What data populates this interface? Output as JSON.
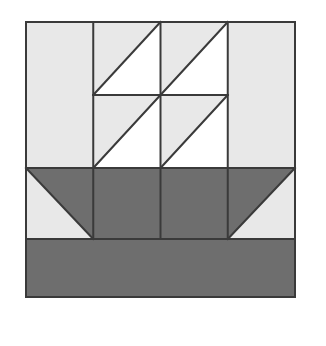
{
  "image": {
    "title": "Sailboat quilt block",
    "width": 326,
    "height": 346,
    "background_color": "#ffffff"
  },
  "block": {
    "name": "sailboat-quilt-block",
    "x": 26,
    "y": 22,
    "width": 269,
    "height": 275,
    "columns": 4,
    "rows": 4,
    "column_edges": [
      26,
      93.25,
      160.5,
      227.75,
      295
    ],
    "row_edges": [
      22,
      95,
      168,
      239,
      297
    ],
    "outline_color": "#3a3a3a",
    "outline_width": 2
  },
  "colors": {
    "background_fabric": "#e8e8e8",
    "sail_fabric": "#ffffff",
    "hull_fabric": "#6e6e6e",
    "water_fabric": "#6e6e6e",
    "seam_line": "#3a3a3a",
    "page_white": "#ffffff"
  },
  "legend": {
    "background_label": "light gray background",
    "sail_label": "white sail",
    "hull_label": "dark gray hull",
    "water_label": "dark gray water"
  },
  "patches": [
    {
      "name": "patch-r1c1-background",
      "row": 1,
      "col": 1,
      "shape": "square",
      "points": "26,22 93.25,22 93.25,95 26,95",
      "fill": "#e8e8e8",
      "label": "background"
    },
    {
      "name": "patch-r1c2-sail-upper",
      "row": 1,
      "col": 2,
      "shape": "triangle",
      "points": "93.25,22 160.5,22 93.25,95",
      "fill": "#e8e8e8",
      "label": "background half"
    },
    {
      "name": "patch-r1c2-sail-lower",
      "row": 1,
      "col": 2,
      "shape": "triangle",
      "points": "160.5,22 160.5,95 93.25,95",
      "fill": "#ffffff",
      "label": "sail half"
    },
    {
      "name": "patch-r1c3-sail-upper",
      "row": 1,
      "col": 3,
      "shape": "triangle",
      "points": "160.5,22 227.75,22 160.5,95",
      "fill": "#e8e8e8",
      "label": "background half"
    },
    {
      "name": "patch-r1c3-sail-lower",
      "row": 1,
      "col": 3,
      "shape": "triangle",
      "points": "227.75,22 227.75,95 160.5,95",
      "fill": "#ffffff",
      "label": "sail half"
    },
    {
      "name": "patch-r1c4-background",
      "row": 1,
      "col": 4,
      "shape": "square",
      "points": "227.75,22 295,22 295,95 227.75,95",
      "fill": "#e8e8e8",
      "label": "background"
    },
    {
      "name": "patch-r2c1-background",
      "row": 2,
      "col": 1,
      "shape": "square",
      "points": "26,95 93.25,95 93.25,168 26,168",
      "fill": "#e8e8e8",
      "label": "background"
    },
    {
      "name": "patch-r2c2-sail-upper",
      "row": 2,
      "col": 2,
      "shape": "triangle",
      "points": "93.25,95 160.5,95 93.25,168",
      "fill": "#e8e8e8",
      "label": "background half"
    },
    {
      "name": "patch-r2c2-sail-lower",
      "row": 2,
      "col": 2,
      "shape": "triangle",
      "points": "160.5,95 160.5,168 93.25,168",
      "fill": "#ffffff",
      "label": "sail half"
    },
    {
      "name": "patch-r2c3-sail-upper",
      "row": 2,
      "col": 3,
      "shape": "triangle",
      "points": "160.5,95 227.75,95 160.5,168",
      "fill": "#e8e8e8",
      "label": "background half"
    },
    {
      "name": "patch-r2c3-sail-lower",
      "row": 2,
      "col": 3,
      "shape": "triangle",
      "points": "227.75,95 227.75,168 160.5,168",
      "fill": "#ffffff",
      "label": "sail half"
    },
    {
      "name": "patch-r2c4-background",
      "row": 2,
      "col": 4,
      "shape": "square",
      "points": "227.75,95 295,95 295,168 227.75,168",
      "fill": "#e8e8e8",
      "label": "background"
    },
    {
      "name": "patch-r3c1-hull-upper",
      "row": 3,
      "col": 1,
      "shape": "triangle",
      "points": "26,168 93.25,168 93.25,239",
      "fill": "#6e6e6e",
      "label": "hull bow"
    },
    {
      "name": "patch-r3c1-background-lower",
      "row": 3,
      "col": 1,
      "shape": "triangle",
      "points": "26,168 93.25,239 26,239",
      "fill": "#e8e8e8",
      "label": "background half"
    },
    {
      "name": "patch-r3c2-hull",
      "row": 3,
      "col": 2,
      "shape": "square",
      "points": "93.25,168 160.5,168 160.5,239 93.25,239",
      "fill": "#6e6e6e",
      "label": "hull"
    },
    {
      "name": "patch-r3c3-hull",
      "row": 3,
      "col": 3,
      "shape": "square",
      "points": "160.5,168 227.75,168 227.75,239 160.5,239",
      "fill": "#6e6e6e",
      "label": "hull"
    },
    {
      "name": "patch-r3c4-hull-upper",
      "row": 3,
      "col": 4,
      "shape": "triangle",
      "points": "227.75,168 295,168 227.75,239",
      "fill": "#6e6e6e",
      "label": "hull stern"
    },
    {
      "name": "patch-r3c4-background-lower",
      "row": 3,
      "col": 4,
      "shape": "triangle",
      "points": "295,168 295,239 227.75,239",
      "fill": "#e8e8e8",
      "label": "background half"
    },
    {
      "name": "patch-r4-water",
      "row": 4,
      "col": 0,
      "shape": "rectangle",
      "points": "26,239 295,239 295,297 26,297",
      "fill": "#6e6e6e",
      "label": "water band"
    }
  ],
  "seams": [
    {
      "name": "seam-vertical-col1",
      "x1": 93.25,
      "y1": 22,
      "x2": 93.25,
      "y2": 239
    },
    {
      "name": "seam-vertical-col2",
      "x1": 160.5,
      "y1": 22,
      "x2": 160.5,
      "y2": 239
    },
    {
      "name": "seam-vertical-col3",
      "x1": 227.75,
      "y1": 22,
      "x2": 227.75,
      "y2": 239
    },
    {
      "name": "seam-horizontal-sail-mid",
      "x1": 93.25,
      "y1": 95,
      "x2": 227.75,
      "y2": 95
    },
    {
      "name": "seam-horizontal-hull-top",
      "x1": 26,
      "y1": 168,
      "x2": 295,
      "y2": 168
    },
    {
      "name": "seam-horizontal-waterline",
      "x1": 26,
      "y1": 239,
      "x2": 295,
      "y2": 239
    },
    {
      "name": "seam-diagonal-r1c2",
      "x1": 93.25,
      "y1": 95,
      "x2": 160.5,
      "y2": 22
    },
    {
      "name": "seam-diagonal-r1c3",
      "x1": 160.5,
      "y1": 95,
      "x2": 227.75,
      "y2": 22
    },
    {
      "name": "seam-diagonal-r2c2",
      "x1": 93.25,
      "y1": 168,
      "x2": 160.5,
      "y2": 95
    },
    {
      "name": "seam-diagonal-r2c3",
      "x1": 160.5,
      "y1": 168,
      "x2": 227.75,
      "y2": 95
    },
    {
      "name": "seam-diagonal-r3c1",
      "x1": 26,
      "y1": 168,
      "x2": 93.25,
      "y2": 239
    },
    {
      "name": "seam-diagonal-r3c4",
      "x1": 295,
      "y1": 168,
      "x2": 227.75,
      "y2": 239
    }
  ]
}
